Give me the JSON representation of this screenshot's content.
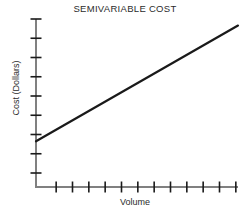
{
  "chart_data": {
    "type": "line",
    "title": "SEMIVARIABLE COST",
    "xlabel": "Volume",
    "ylabel": "Cost (Dollars)",
    "grid": false,
    "legend": "none",
    "axis_color": "#808080",
    "line_color": "#1a1a1a",
    "text_color": "#2b2b2b",
    "xlim": [
      0,
      12
    ],
    "ylim": [
      0,
      9
    ],
    "x_tick_count": 12,
    "y_tick_count": 9,
    "x_tick_labels": [],
    "y_tick_labels": [],
    "series": [
      {
        "name": "Semivariable cost",
        "x": [
          0,
          12
        ],
        "values": [
          2.45,
          8.65
        ],
        "intercept": 2.45,
        "slope": 0.517
      }
    ],
    "annotations": []
  },
  "axes": {
    "origin_x": 36,
    "origin_y": 187,
    "y_axis_top": 19,
    "x_axis_right": 238
  }
}
